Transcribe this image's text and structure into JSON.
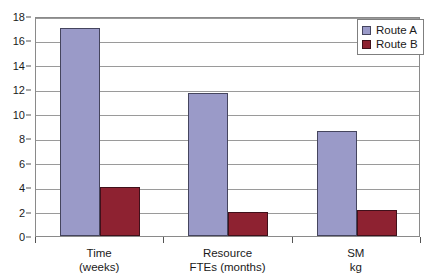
{
  "chart_data": {
    "type": "bar",
    "title": "",
    "subtitle": "",
    "xlabel": "",
    "ylabel": "",
    "categories": [
      "Time\n(weeks)",
      "Resource\nFTEs (months)",
      "SM\nkg"
    ],
    "category_lines": [
      [
        "Time",
        "(weeks)"
      ],
      [
        "Resource",
        "FTEs (months)"
      ],
      [
        "SM",
        "kg"
      ]
    ],
    "series": [
      {
        "name": "Route A",
        "color": "#9a9ac8",
        "values": [
          17,
          11.7,
          8.6
        ]
      },
      {
        "name": "Route B",
        "color": "#8e2231",
        "values": [
          4,
          2,
          2.1
        ]
      }
    ],
    "ylim": [
      0,
      18
    ],
    "ytick_step": 2,
    "yticks": [
      0,
      2,
      4,
      6,
      8,
      10,
      12,
      14,
      16,
      18
    ],
    "ytick_labels": [
      "0",
      "2",
      "4",
      "6",
      "8",
      "10",
      "12",
      "14",
      "16",
      "18"
    ],
    "grid": true,
    "grid_axis": "y",
    "legend_position": "top-right",
    "legend_entries": [
      "Route A",
      "Route B"
    ]
  },
  "colors": {
    "series_a": "#9a9ac8",
    "series_b": "#8e2231",
    "gridline": "#9a9a9a",
    "axis": "#555555",
    "plot_border": "#8a8a8a",
    "text": "#1a1a1a",
    "background": "#ffffff"
  }
}
